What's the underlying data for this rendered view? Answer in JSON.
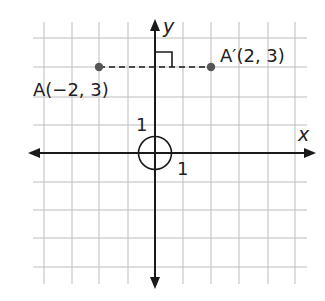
{
  "diagram": {
    "type": "coordinate-plane",
    "axes": {
      "x_label": "x",
      "y_label": "y",
      "unit_label_x": "1",
      "unit_label_y": "1"
    },
    "grid": {
      "x_range": [
        -4,
        5
      ],
      "y_range": [
        -5,
        4
      ],
      "gridline_color": "#b8b8b8"
    },
    "points": [
      {
        "name": "A",
        "label": "A(−2, 3)",
        "x": -2,
        "y": 3,
        "color": "#555555"
      },
      {
        "name": "A'",
        "label": "A′(2, 3)",
        "x": 2,
        "y": 3,
        "color": "#555555"
      }
    ],
    "segment": {
      "from": "A",
      "to": "A'",
      "style": "dashed"
    },
    "right_angle_marker": {
      "at": "intersection with y-axis"
    },
    "origin_circle": true,
    "colors": {
      "axis": "#1a1a1a",
      "point": "#555555"
    }
  }
}
